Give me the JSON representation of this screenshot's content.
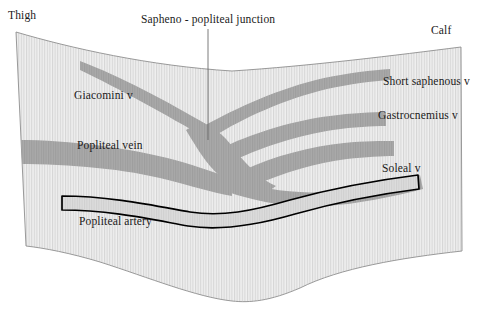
{
  "figure": {
    "type": "anatomical-diagram",
    "region": "popliteal fossa",
    "colors": {
      "limb_fill": "#ededed",
      "limb_stripe": "#d4d4d4",
      "limb_outline": "#8a8a8a",
      "vein_fill": "#a8a8a8",
      "vein_stripe": "#9a9a9a",
      "artery_fill": "#d8d8d8",
      "artery_outline": "#000000",
      "leader_line": "#555555",
      "text": "#1a1a1a"
    }
  },
  "labels": {
    "thigh": "Thigh",
    "calf": "Calf",
    "sapheno_popliteal_junction": "Sapheno - popliteal junction",
    "giacomini_vein": "Giacomini v",
    "popliteal_vein": "Popliteal vein",
    "popliteal_artery": "Popliteal artery",
    "short_saphenous_vein": "Short saphenous v",
    "gastrocnemius_vein": "Gastrocnemius v",
    "soleal_vein": "Soleal v"
  },
  "vessels": [
    {
      "name": "Giacomini v",
      "kind": "vein",
      "side": "thigh",
      "description": "thin tapering tributary descending from upper thigh to the junction"
    },
    {
      "name": "Popliteal vein",
      "kind": "vein",
      "side": "thigh",
      "description": "thick main venous trunk running horizontally across the fossa"
    },
    {
      "name": "Short saphenous v",
      "kind": "vein",
      "side": "calf",
      "description": "superficial calf vein ascending to the junction"
    },
    {
      "name": "Gastrocnemius v",
      "kind": "vein",
      "side": "calf",
      "description": "muscular tributary draining gastrocnemius"
    },
    {
      "name": "Soleal v",
      "kind": "vein",
      "side": "calf",
      "description": "muscular tributary draining soleus"
    },
    {
      "name": "Popliteal artery",
      "kind": "artery",
      "side": "both",
      "description": "outlined artery running deep and parallel below the popliteal vein"
    }
  ]
}
